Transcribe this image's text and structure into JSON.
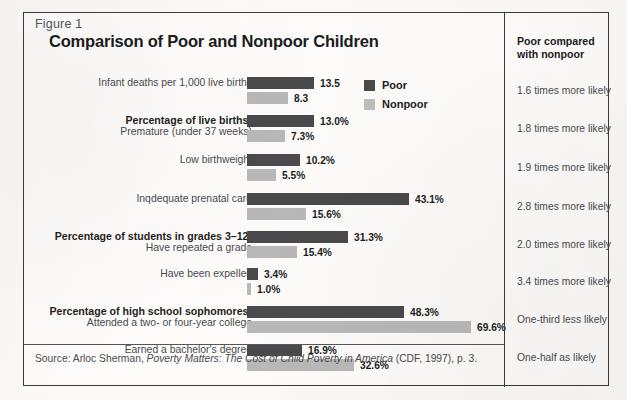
{
  "figure": {
    "label": "Figure 1",
    "title": "Comparison of Poor and Nonpoor Children",
    "source_prefix": "Source: Arloc Sherman, ",
    "source_italic": "Poverty Matters: The Cost of Child Poverty in America",
    "source_suffix": " (CDF, 1997), p. 3."
  },
  "legend": {
    "poor_label": "Poor",
    "nonpoor_label": "Nonpoor",
    "poor_color": "#4a4a4c",
    "nonpoor_color": "#bdbdbd"
  },
  "right_column": {
    "heading_line1": "Poor compared",
    "heading_line2": "with nonpoor",
    "items": [
      "1.6 times more likely",
      "1.8 times more likely",
      "1.9 times more likely",
      "2.8 times more likely",
      "2.0 times more likely",
      "3.4 times more likely",
      "One-third less likely",
      "One-half as likely"
    ]
  },
  "chart_data": {
    "type": "bar",
    "title": "Comparison of Poor and Nonpoor Children",
    "xlabel": "",
    "ylabel": "",
    "orientation": "horizontal",
    "grid": false,
    "legend_position": "top-right",
    "note": "Each category group is scaled independently; bar lengths are proportional within the figure as drawn.",
    "categories": [
      "Infant deaths per 1,000 live births",
      "Percentage of live births: Premature (under 37 weeks)",
      "Low birthweight",
      "Inqdequate prenatal care",
      "Percentage of students in grades 3–12: Have repeated a grade",
      "Have been expelled",
      "Percentage of high school sophomores: Attended a two- or four-year college",
      "Earned a bachelor's degree"
    ],
    "series": [
      {
        "name": "Poor",
        "values": [
          13.5,
          13.0,
          10.2,
          43.1,
          31.3,
          3.4,
          48.3,
          16.9
        ]
      },
      {
        "name": "Nonpoor",
        "values": [
          8.3,
          7.3,
          5.5,
          15.6,
          15.4,
          1.0,
          69.6,
          32.6
        ]
      }
    ],
    "value_labels": {
      "poor": [
        "13.5",
        "13.0%",
        "10.2%",
        "43.1%",
        "31.3%",
        "3.4%",
        "48.3%",
        "16.9%"
      ],
      "nonpoor": [
        "8.3",
        "7.3%",
        "5.5%",
        "15.6%",
        "15.4%",
        "1.0%",
        "69.6%",
        "32.6%"
      ]
    },
    "comparison": [
      "1.6 times more likely",
      "1.8 times more likely",
      "1.9 times more likely",
      "2.8 times more likely",
      "2.0 times more likely",
      "3.4 times more likely",
      "One-third less likely",
      "One-half as likely"
    ]
  },
  "rows": [
    {
      "header": "",
      "sub": "Infant deaths per 1,000 live births",
      "poor_label": "13.5",
      "nonpoor_label": "8.3",
      "poor_w": 67,
      "nonpoor_w": 41
    },
    {
      "header": "Percentage of live births:",
      "sub": "Premature (under 37 weeks)",
      "poor_label": "13.0%",
      "nonpoor_label": "7.3%",
      "poor_w": 67,
      "nonpoor_w": 38
    },
    {
      "header": "",
      "sub": "Low birthweight",
      "poor_label": "10.2%",
      "nonpoor_label": "5.5%",
      "poor_w": 53,
      "nonpoor_w": 29
    },
    {
      "header": "",
      "sub": "Inqdequate prenatal care",
      "poor_label": "43.1%",
      "nonpoor_label": "15.6%",
      "poor_w": 162,
      "nonpoor_w": 59
    },
    {
      "header": "Percentage of students in grades 3–12:",
      "sub": "Have repeated a grade",
      "poor_label": "31.3%",
      "nonpoor_label": "15.4%",
      "poor_w": 101,
      "nonpoor_w": 50
    },
    {
      "header": "",
      "sub": "Have been expelled",
      "poor_label": "3.4%",
      "nonpoor_label": "1.0%",
      "poor_w": 11,
      "nonpoor_w": 4
    },
    {
      "header": "Percentage of high school sophomores:",
      "sub": "Attended a two- or four-year college",
      "poor_label": "48.3%",
      "nonpoor_label": "69.6%",
      "poor_w": 157,
      "nonpoor_w": 224
    },
    {
      "header": "",
      "sub": "Earned a bachelor's degree",
      "poor_label": "16.9%",
      "nonpoor_label": "32.6%",
      "poor_w": 55,
      "nonpoor_w": 107
    }
  ],
  "layout": {
    "group_tops": [
      64,
      102,
      141,
      180,
      218,
      255,
      293,
      331
    ],
    "rc_item_tops": [
      72,
      110,
      149,
      188,
      226,
      263,
      301,
      339
    ]
  }
}
